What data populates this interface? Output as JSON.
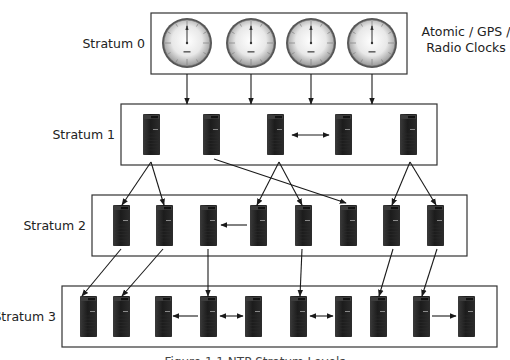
{
  "diagram": {
    "caption": "Figure 1.1 NTP Stratum Levels",
    "side_label_lines": [
      "Atomic / GPS /",
      "Radio Clocks"
    ],
    "colors": {
      "box_stroke": "#333333",
      "arrow": "#1a1a1a",
      "server_body": "#1e1e1e",
      "clock_face": "#e6e6e6"
    },
    "tiers": [
      {
        "label": "Stratum 0",
        "box": {
          "x": 151,
          "y": 13,
          "w": 256,
          "h": 61
        },
        "node_type": "clock",
        "nodes": [
          {
            "cx": 187,
            "cy": 43
          },
          {
            "cx": 251,
            "cy": 43
          },
          {
            "cx": 311,
            "cy": 43
          },
          {
            "cx": 372,
            "cy": 43
          }
        ]
      },
      {
        "label": "Stratum 1",
        "box": {
          "x": 121,
          "y": 104,
          "w": 316,
          "h": 61
        },
        "node_type": "server",
        "nodes": [
          {
            "x": 143
          },
          {
            "x": 203
          },
          {
            "x": 267
          },
          {
            "x": 335
          },
          {
            "x": 400
          }
        ],
        "node_y": 114
      },
      {
        "label": "Stratum 2",
        "box": {
          "x": 92,
          "y": 195,
          "w": 375,
          "h": 61
        },
        "node_type": "server",
        "nodes": [
          {
            "x": 113
          },
          {
            "x": 156
          },
          {
            "x": 200
          },
          {
            "x": 250
          },
          {
            "x": 295
          },
          {
            "x": 340
          },
          {
            "x": 383
          },
          {
            "x": 427
          }
        ],
        "node_y": 205
      },
      {
        "label": "Stratum 3",
        "box": {
          "x": 62,
          "y": 286,
          "w": 435,
          "h": 61
        },
        "node_type": "server",
        "nodes": [
          {
            "x": 80
          },
          {
            "x": 113
          },
          {
            "x": 155
          },
          {
            "x": 200
          },
          {
            "x": 245
          },
          {
            "x": 290
          },
          {
            "x": 335
          },
          {
            "x": 370
          },
          {
            "x": 413
          },
          {
            "x": 458
          }
        ],
        "node_y": 296
      }
    ],
    "edges": [
      {
        "from": [
          187,
          74
        ],
        "to": [
          187,
          104
        ],
        "type": "arrow"
      },
      {
        "from": [
          251,
          74
        ],
        "to": [
          251,
          104
        ],
        "type": "arrow"
      },
      {
        "from": [
          311,
          74
        ],
        "to": [
          311,
          104
        ],
        "type": "arrow"
      },
      {
        "from": [
          372,
          74
        ],
        "to": [
          372,
          104
        ],
        "type": "arrow"
      },
      {
        "from": [
          292,
          135
        ],
        "to": [
          329,
          135
        ],
        "type": "double"
      },
      {
        "from": [
          151,
          162
        ],
        "to": [
          122,
          205
        ],
        "type": "arrow"
      },
      {
        "from": [
          151,
          162
        ],
        "to": [
          164,
          205
        ],
        "type": "arrow"
      },
      {
        "from": [
          279,
          162
        ],
        "to": [
          257,
          205
        ],
        "type": "arrow"
      },
      {
        "from": [
          279,
          162
        ],
        "to": [
          302,
          205
        ],
        "type": "arrow"
      },
      {
        "from": [
          214,
          159
        ],
        "to": [
          346,
          203
        ],
        "type": "arrow"
      },
      {
        "from": [
          410,
          162
        ],
        "to": [
          392,
          205
        ],
        "type": "arrow"
      },
      {
        "from": [
          410,
          162
        ],
        "to": [
          436,
          205
        ],
        "type": "arrow"
      },
      {
        "from": [
          247,
          225
        ],
        "to": [
          221,
          225
        ],
        "type": "arrow"
      },
      {
        "from": [
          121,
          249
        ],
        "to": [
          82,
          296
        ],
        "type": "arrow"
      },
      {
        "from": [
          163,
          249
        ],
        "to": [
          122,
          296
        ],
        "type": "arrow"
      },
      {
        "from": [
          208,
          249
        ],
        "to": [
          208,
          296
        ],
        "type": "arrow"
      },
      {
        "from": [
          302,
          249
        ],
        "to": [
          300,
          296
        ],
        "type": "arrow"
      },
      {
        "from": [
          393,
          249
        ],
        "to": [
          379,
          296
        ],
        "type": "arrow"
      },
      {
        "from": [
          437,
          249
        ],
        "to": [
          422,
          296
        ],
        "type": "arrow"
      },
      {
        "from": [
          198,
          316
        ],
        "to": [
          173,
          316
        ],
        "type": "arrow"
      },
      {
        "from": [
          220,
          316
        ],
        "to": [
          243,
          316
        ],
        "type": "double"
      },
      {
        "from": [
          310,
          316
        ],
        "to": [
          333,
          316
        ],
        "type": "double"
      },
      {
        "from": [
          432,
          316
        ],
        "to": [
          456,
          316
        ],
        "type": "arrow"
      }
    ]
  }
}
